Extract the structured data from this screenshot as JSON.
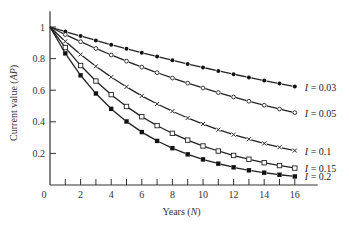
{
  "chart_data": {
    "type": "line",
    "title": "",
    "xlabel": "Years (N)",
    "ylabel": "Current value (AP)",
    "xlim": [
      0,
      17.5
    ],
    "ylim": [
      0,
      1.1
    ],
    "x_ticks": [
      0,
      2,
      4,
      6,
      8,
      10,
      12,
      14,
      16
    ],
    "x_minor_ticks": [
      1,
      3,
      5,
      7,
      9,
      11,
      13,
      15
    ],
    "y_ticks": [
      0.2,
      0.4,
      0.6,
      0.8,
      1
    ],
    "y_tick_labels": [
      "0.2",
      "0.4",
      "0.6",
      "0.8",
      "1"
    ],
    "x_tick_labels": [
      "0",
      "2",
      "4",
      "6",
      "8",
      "10",
      "12",
      "14",
      "16"
    ],
    "grid": false,
    "legend_position": "inline-right",
    "x": [
      0,
      1,
      2,
      3,
      4,
      5,
      6,
      7,
      8,
      9,
      10,
      11,
      12,
      13,
      14,
      15,
      16
    ],
    "series": [
      {
        "name": "I = 0.03",
        "marker": "filled-circle",
        "values": [
          1,
          0.971,
          0.943,
          0.915,
          0.888,
          0.863,
          0.837,
          0.813,
          0.789,
          0.766,
          0.744,
          0.722,
          0.701,
          0.681,
          0.661,
          0.642,
          0.623
        ]
      },
      {
        "name": "I = 0.05",
        "marker": "open-circle",
        "values": [
          1,
          0.952,
          0.907,
          0.864,
          0.823,
          0.784,
          0.746,
          0.711,
          0.677,
          0.645,
          0.614,
          0.585,
          0.557,
          0.53,
          0.505,
          0.481,
          0.458
        ]
      },
      {
        "name": "I = 0.1",
        "marker": "x",
        "values": [
          1,
          0.909,
          0.826,
          0.751,
          0.683,
          0.621,
          0.564,
          0.513,
          0.467,
          0.424,
          0.386,
          0.35,
          0.319,
          0.29,
          0.263,
          0.239,
          0.218
        ]
      },
      {
        "name": "I = 0.15",
        "marker": "open-square",
        "values": [
          1,
          0.87,
          0.756,
          0.658,
          0.572,
          0.497,
          0.432,
          0.376,
          0.327,
          0.284,
          0.247,
          0.215,
          0.187,
          0.163,
          0.141,
          0.123,
          0.107
        ]
      },
      {
        "name": "I = 0.2",
        "marker": "filled-square",
        "values": [
          1,
          0.833,
          0.694,
          0.579,
          0.482,
          0.402,
          0.335,
          0.279,
          0.233,
          0.194,
          0.162,
          0.135,
          0.112,
          0.093,
          0.078,
          0.065,
          0.054
        ]
      }
    ]
  },
  "axes": {
    "origin_label": "0"
  }
}
